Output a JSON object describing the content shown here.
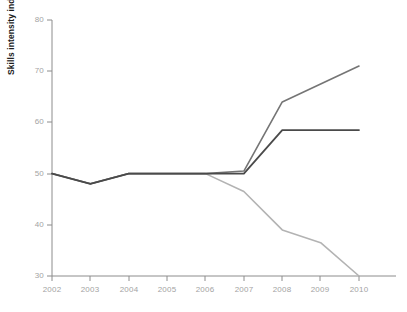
{
  "chart_data": {
    "type": "line",
    "title": "",
    "xlabel": "",
    "ylabel": "Skills intensity index relative to 2002",
    "x": [
      2002,
      2003,
      2004,
      2005,
      2006,
      2007,
      2008,
      2009,
      2010
    ],
    "xticklabels": [
      "2002",
      "2003",
      "2004",
      "2005",
      "2006",
      "2007",
      "2008",
      "2009",
      "2010"
    ],
    "yticklabels": [
      "30",
      "40",
      "50",
      "60",
      "70",
      "80"
    ],
    "yticks": [
      30,
      40,
      50,
      60,
      70,
      80
    ],
    "ylim": [
      30,
      80
    ],
    "xlim": [
      2002,
      2010
    ],
    "grid": false,
    "legend": "none",
    "series": [
      {
        "name": "series-medium-gray",
        "color": "#757575",
        "values": [
          50,
          48,
          50,
          50,
          50,
          50.5,
          64,
          67.5,
          71
        ]
      },
      {
        "name": "series-dark-gray",
        "color": "#4a4a4a",
        "values": [
          50,
          48,
          50,
          50,
          50,
          50,
          58.5,
          58.5,
          58.5
        ]
      },
      {
        "name": "series-light-gray",
        "color": "#b3b3b3",
        "values": [
          50,
          48,
          50,
          50,
          50,
          46.5,
          39,
          36.5,
          30
        ]
      }
    ]
  },
  "axes": {
    "y_axis_title": "Skills intensity index relative to 2002",
    "y_tick_labels": [
      "80",
      "70",
      "60",
      "50",
      "40",
      "30"
    ],
    "x_tick_labels": [
      "2002",
      "2003",
      "2004",
      "2005",
      "2006",
      "2007",
      "2008",
      "2009",
      "2010"
    ]
  },
  "colors": {
    "axis": "#8c8c8c",
    "tick_text": "#a3a3a3",
    "axis_title": "#1d1d1d",
    "line_dark": "#4a4a4a",
    "line_medium": "#757575",
    "line_light": "#b3b3b3",
    "background": "#ffffff"
  }
}
